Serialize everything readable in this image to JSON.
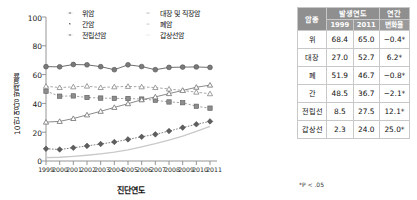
{
  "chart_data": {
    "type": "line",
    "title": "",
    "xlabel": "진단연도",
    "ylabel": "10만 명당 발생률",
    "x": [
      1999,
      2000,
      2001,
      2002,
      2003,
      2004,
      2005,
      2006,
      2007,
      2008,
      2009,
      2010,
      2011
    ],
    "xlim": [
      1999,
      2011
    ],
    "ylim": [
      0,
      100
    ],
    "yticks": [
      0,
      20,
      40,
      60,
      80,
      100
    ],
    "grid": false,
    "legend_position": "top",
    "series": [
      {
        "name": "위암",
        "marker": "filled-circle",
        "values": [
          65.5,
          65.4,
          67.0,
          66.8,
          65.5,
          63.4,
          66.8,
          65.6,
          63.4,
          65.0,
          65.2,
          65.3,
          65.0
        ]
      },
      {
        "name": "간암",
        "marker": "filled-square",
        "values": [
          48.5,
          45.0,
          45.2,
          44.1,
          43.7,
          43.5,
          43.4,
          43.0,
          42.2,
          41.0,
          40.5,
          38.0,
          36.7
        ]
      },
      {
        "name": "전립선암",
        "marker": "filled-diamond",
        "values": [
          8.5,
          8.0,
          9.2,
          10.5,
          11.8,
          13.2,
          15.0,
          16.8,
          18.5,
          20.8,
          23.2,
          25.5,
          27.5
        ]
      },
      {
        "name": "대장 및 직장암",
        "marker": "open-triangle",
        "values": [
          27.0,
          27.5,
          29.5,
          32.0,
          34.5,
          37.2,
          39.8,
          42.5,
          44.5,
          46.8,
          49.0,
          51.2,
          52.7
        ]
      },
      {
        "name": "폐암",
        "marker": "open-triangle-dashed",
        "values": [
          51.9,
          51.0,
          51.5,
          52.0,
          51.0,
          51.5,
          51.8,
          51.5,
          51.0,
          50.0,
          49.0,
          47.8,
          46.7
        ]
      },
      {
        "name": "갑상선암",
        "marker": "none",
        "values": [
          2.3,
          2.6,
          3.2,
          4.0,
          5.0,
          6.2,
          7.8,
          9.8,
          12.0,
          14.5,
          17.2,
          20.5,
          24.0
        ]
      }
    ]
  },
  "table": {
    "headers": {
      "cancer_type": "암종",
      "incidence_year": "발생연도",
      "year_1999": "1999",
      "year_2011": "2011",
      "annual": "연간",
      "change_rate": "변화율"
    },
    "rows": [
      {
        "type": "위",
        "y1999": "68.4",
        "y2011": "65.0",
        "change": "−0.4*"
      },
      {
        "type": "대장",
        "y1999": "27.0",
        "y2011": "52.7",
        "change": "6.2*"
      },
      {
        "type": "폐",
        "y1999": "51.9",
        "y2011": "46.7",
        "change": "−0.8*"
      },
      {
        "type": "간",
        "y1999": "48.5",
        "y2011": "36.7",
        "change": "−2.1*"
      },
      {
        "type": "전립선",
        "y1999": "8.5",
        "y2011": "27.5",
        "change": "12.1*"
      },
      {
        "type": "갑상선",
        "y1999": "2.3",
        "y2011": "24.0",
        "change": "25.0*"
      }
    ],
    "footnote": "*P < .05"
  },
  "axis": {
    "yticks": [
      "100",
      "80",
      "60",
      "40",
      "20",
      "0"
    ],
    "xticks": [
      "1999",
      "2000",
      "2001",
      "2002",
      "2003",
      "2004",
      "2005",
      "2006",
      "2007",
      "2008",
      "2009",
      "2010",
      "2011"
    ]
  },
  "colors": {
    "line": "#6f6f6f",
    "header_bg": "#8f8f8f",
    "thyroid": "#cccccc"
  }
}
